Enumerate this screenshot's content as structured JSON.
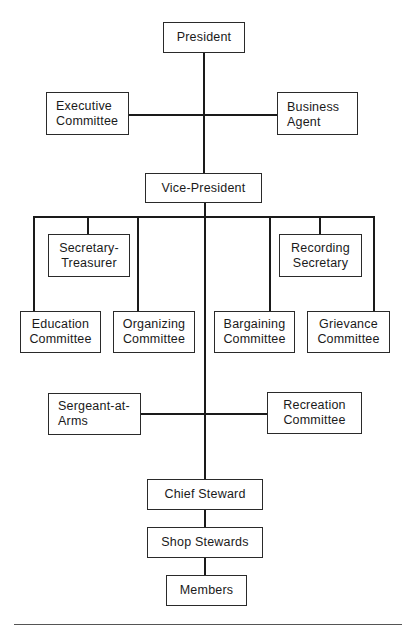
{
  "chart": {
    "type": "org-chart",
    "nodes": {
      "president": "President",
      "executive_committee": "Executive\nCommittee",
      "business_agent": "Business\nAgent",
      "vice_president": "Vice-President",
      "secretary_treasurer": "Secretary-\nTreasurer",
      "recording_secretary": "Recording\nSecretary",
      "education_committee": "Education\nCommittee",
      "organizing_committee": "Organizing\nCommittee",
      "bargaining_committee": "Bargaining\nCommittee",
      "grievance_committee": "Grievance\nCommittee",
      "sergeant_at_arms": "Sergeant-at-\nArms",
      "recreation_committee": "Recreation\nCommittee",
      "chief_steward": "Chief Steward",
      "shop_stewards": "Shop Stewards",
      "members": "Members"
    },
    "edges": [
      [
        "President",
        "Executive Committee"
      ],
      [
        "President",
        "Business Agent"
      ],
      [
        "President",
        "Vice-President"
      ],
      [
        "Vice-President",
        "Secretary-Treasurer"
      ],
      [
        "Vice-President",
        "Recording Secretary"
      ],
      [
        "Vice-President",
        "Education Committee"
      ],
      [
        "Vice-President",
        "Organizing Committee"
      ],
      [
        "Vice-President",
        "Bargaining Committee"
      ],
      [
        "Vice-President",
        "Grievance Committee"
      ],
      [
        "Vice-President",
        "Sergeant-at-Arms"
      ],
      [
        "Vice-President",
        "Recreation Committee"
      ],
      [
        "Vice-President",
        "Chief Steward"
      ],
      [
        "Chief Steward",
        "Shop Stewards"
      ],
      [
        "Shop Stewards",
        "Members"
      ]
    ]
  }
}
